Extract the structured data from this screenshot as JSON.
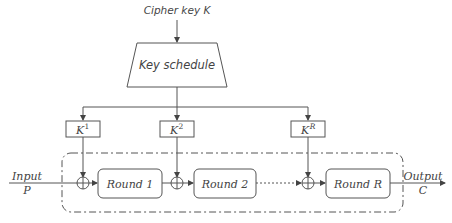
{
  "diagram": {
    "cipher_key_label": "Cipher key K",
    "key_schedule_label": "Key schedule",
    "round_keys": [
      {
        "base": "K",
        "sup": "1"
      },
      {
        "base": "K",
        "sup": "2"
      },
      {
        "base": "K",
        "sup": "R"
      }
    ],
    "rounds": [
      "Round 1",
      "Round 2",
      "Round R"
    ],
    "input": {
      "label": "Input",
      "symbol": "P"
    },
    "output": {
      "label": "Output",
      "symbol": "C"
    },
    "colors": {
      "stroke": "#555555",
      "text": "#444444",
      "background": "#ffffff"
    }
  }
}
